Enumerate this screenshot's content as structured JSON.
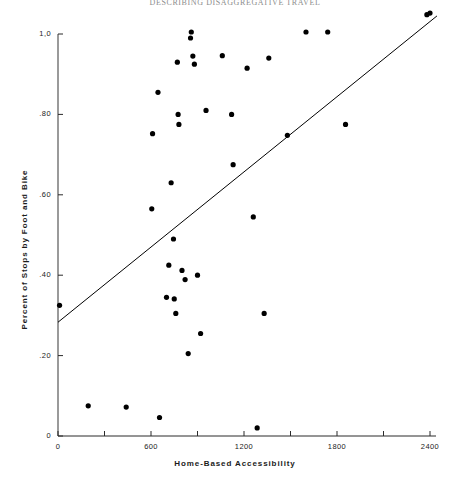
{
  "page": {
    "running_header": "DESCRIBING DISAGGREGATIVE TRAVEL",
    "background_color": "#ffffff",
    "ink_color": "#000000"
  },
  "chart_data": {
    "type": "scatter",
    "title": "",
    "subtitle": "",
    "xlabel": "Home-Based Accessibility",
    "ylabel": "Percent of Stops by Foot and Bike",
    "xlim": [
      0,
      2400
    ],
    "ylim": [
      0,
      1.0
    ],
    "grid": false,
    "legend": "none",
    "marker_color": "#000000",
    "marker_size_px": 4,
    "x_ticks": [
      0,
      300,
      600,
      900,
      1200,
      1500,
      1800,
      2100,
      2400
    ],
    "x_tick_labels": [
      "0",
      "",
      "600",
      "",
      "1200",
      "",
      "1800",
      "",
      "2400"
    ],
    "x_major_ticks": [
      0,
      600,
      1200,
      1800,
      2400
    ],
    "x_major_tick_labels": [
      "0",
      "600",
      "1200",
      "1800",
      "2400"
    ],
    "y_ticks": [
      0,
      0.2,
      0.4,
      0.6,
      0.8,
      1.0
    ],
    "y_tick_labels": [
      "0",
      ".20",
      ".40",
      ".60",
      ".80",
      "1,0"
    ],
    "points": [
      {
        "x": 10,
        "y": 0.325
      },
      {
        "x": 195,
        "y": 0.075
      },
      {
        "x": 440,
        "y": 0.072
      },
      {
        "x": 605,
        "y": 0.565
      },
      {
        "x": 610,
        "y": 0.752
      },
      {
        "x": 645,
        "y": 0.855
      },
      {
        "x": 655,
        "y": 0.046
      },
      {
        "x": 700,
        "y": 0.345
      },
      {
        "x": 715,
        "y": 0.425
      },
      {
        "x": 730,
        "y": 0.63
      },
      {
        "x": 745,
        "y": 0.49
      },
      {
        "x": 750,
        "y": 0.341
      },
      {
        "x": 760,
        "y": 0.305
      },
      {
        "x": 770,
        "y": 0.93
      },
      {
        "x": 775,
        "y": 0.8
      },
      {
        "x": 780,
        "y": 0.775
      },
      {
        "x": 800,
        "y": 0.412
      },
      {
        "x": 820,
        "y": 0.389
      },
      {
        "x": 840,
        "y": 0.205
      },
      {
        "x": 855,
        "y": 0.99
      },
      {
        "x": 860,
        "y": 1.005
      },
      {
        "x": 870,
        "y": 0.945
      },
      {
        "x": 880,
        "y": 0.925
      },
      {
        "x": 900,
        "y": 0.4
      },
      {
        "x": 920,
        "y": 0.255
      },
      {
        "x": 955,
        "y": 0.81
      },
      {
        "x": 1060,
        "y": 0.946
      },
      {
        "x": 1120,
        "y": 0.8
      },
      {
        "x": 1130,
        "y": 0.675
      },
      {
        "x": 1220,
        "y": 0.915
      },
      {
        "x": 1260,
        "y": 0.545
      },
      {
        "x": 1285,
        "y": 0.02
      },
      {
        "x": 1330,
        "y": 0.305
      },
      {
        "x": 1360,
        "y": 0.94
      },
      {
        "x": 1480,
        "y": 0.748
      },
      {
        "x": 1600,
        "y": 1.005
      },
      {
        "x": 1740,
        "y": 1.005
      },
      {
        "x": 1855,
        "y": 0.775
      },
      {
        "x": 2380,
        "y": 1.048
      },
      {
        "x": 2400,
        "y": 1.052
      }
    ],
    "trend_line": {
      "label": "regression line",
      "x_start": 0,
      "y_start": 0.283,
      "x_end": 2445,
      "y_end": 1.045
    }
  }
}
